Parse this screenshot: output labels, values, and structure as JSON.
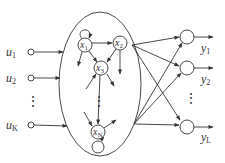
{
  "diagram": {
    "type": "echo-state-network / reservoir",
    "colors": {
      "line": "#333333",
      "background": "#ffffff"
    },
    "inputs": [
      {
        "name": "u",
        "sub": "1"
      },
      {
        "name": "u",
        "sub": "2"
      },
      {
        "name": "u",
        "sub": "K"
      }
    ],
    "input_ellipsis": "⋮",
    "reservoir": {
      "nodes": [
        {
          "name": "x",
          "sub": "1",
          "self_loop": true
        },
        {
          "name": "x",
          "sub": "2",
          "self_loop": false
        },
        {
          "name": "x",
          "sub": "3",
          "self_loop": false
        },
        {
          "name": "x",
          "sub": "N",
          "self_loop": true
        }
      ],
      "ellipsis": "⋮",
      "edges": [
        [
          "x1",
          "x2"
        ],
        [
          "x1",
          "x3"
        ],
        [
          "x2",
          "x3"
        ],
        [
          "x3",
          "xN"
        ]
      ]
    },
    "outputs": [
      {
        "name": "y",
        "sub": "1"
      },
      {
        "name": "y",
        "sub": "2"
      },
      {
        "name": "y",
        "sub": "L"
      }
    ],
    "output_ellipsis": "⋮"
  }
}
